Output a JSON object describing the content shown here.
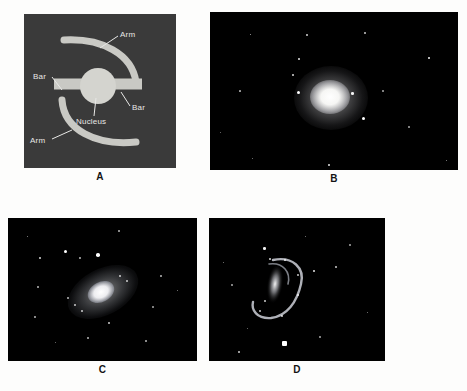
{
  "figure": {
    "caption_letters": [
      "A",
      "B",
      "C",
      "D"
    ],
    "background_color": "#fdfdfc"
  },
  "panels": [
    {
      "letter": "A",
      "type": "schematic-diagram",
      "subject": "barred spiral galaxy structure",
      "background_color": "#3a3a3a",
      "structure_color": "#c9c9c4",
      "labels": [
        {
          "id": "arm-top",
          "text": "Arm"
        },
        {
          "id": "bar-left",
          "text": "Bar"
        },
        {
          "id": "bar-right",
          "text": "Bar"
        },
        {
          "id": "nucleus",
          "text": "Nucleus"
        },
        {
          "id": "arm-bottom",
          "text": "Arm"
        }
      ]
    },
    {
      "letter": "B",
      "type": "photograph",
      "subject": "elliptical galaxy with surrounding field stars",
      "background_color": "#000000"
    },
    {
      "letter": "C",
      "type": "photograph",
      "subject": "inclined barred spiral galaxy with bright nucleus",
      "background_color": "#000000"
    },
    {
      "letter": "D",
      "type": "photograph",
      "subject": "ring-shaped barred galaxy with hooked arm",
      "background_color": "#000000"
    }
  ]
}
